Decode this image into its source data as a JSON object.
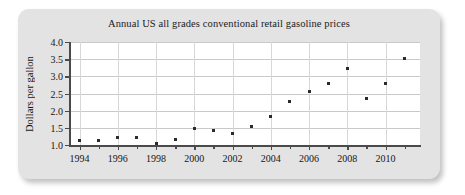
{
  "figure": {
    "panel_color": "#e3e3e3",
    "plot_background": "#ffffff",
    "marker_color": "#2b2b2b",
    "axis_color": "#4a4a4a",
    "grid_color": "#c9c9c9"
  },
  "chart_data": {
    "type": "scatter",
    "title": "Annual US all grades conventional retail gasoline prices",
    "xlabel": "",
    "ylabel": "Dollars per gallon",
    "xlim": [
      1993.5,
      2011.8
    ],
    "ylim": [
      1.0,
      4.0
    ],
    "grid": true,
    "legend": "none",
    "x_tick_labels": [
      "1994",
      "1996",
      "1998",
      "2000",
      "2002",
      "2004",
      "2006",
      "2008",
      "2010"
    ],
    "x_tick_values": [
      1994,
      1996,
      1998,
      2000,
      2002,
      2004,
      2006,
      2008,
      2010
    ],
    "x_minor_ticks": [
      1995,
      1997,
      1999,
      2001,
      2003,
      2005,
      2007,
      2009,
      2011
    ],
    "y_tick_labels": [
      "1.0",
      "1.5",
      "2.0",
      "2.5",
      "3.0",
      "3.5",
      "4.0"
    ],
    "y_tick_values": [
      1.0,
      1.5,
      2.0,
      2.5,
      3.0,
      3.5,
      4.0
    ],
    "x": [
      1994,
      1995,
      1996,
      1997,
      1998,
      1999,
      2000,
      2001,
      2002,
      2003,
      2004,
      2005,
      2006,
      2007,
      2008,
      2009,
      2010,
      2011
    ],
    "values": [
      1.12,
      1.13,
      1.22,
      1.22,
      1.03,
      1.15,
      1.49,
      1.42,
      1.34,
      1.55,
      1.84,
      2.28,
      2.57,
      2.8,
      3.24,
      2.34,
      2.78,
      3.51
    ],
    "points": [
      {
        "year": 1994,
        "price": 1.12
      },
      {
        "year": 1995,
        "price": 1.13
      },
      {
        "year": 1996,
        "price": 1.22
      },
      {
        "year": 1997,
        "price": 1.22
      },
      {
        "year": 1998,
        "price": 1.03
      },
      {
        "year": 1999,
        "price": 1.15
      },
      {
        "year": 2000,
        "price": 1.49
      },
      {
        "year": 2001,
        "price": 1.42
      },
      {
        "year": 2002,
        "price": 1.34
      },
      {
        "year": 2003,
        "price": 1.55
      },
      {
        "year": 2004,
        "price": 1.84
      },
      {
        "year": 2005,
        "price": 2.28
      },
      {
        "year": 2006,
        "price": 2.57
      },
      {
        "year": 2007,
        "price": 2.8
      },
      {
        "year": 2008,
        "price": 3.24
      },
      {
        "year": 2009,
        "price": 2.34
      },
      {
        "year": 2010,
        "price": 2.78
      },
      {
        "year": 2011,
        "price": 3.51
      }
    ]
  }
}
